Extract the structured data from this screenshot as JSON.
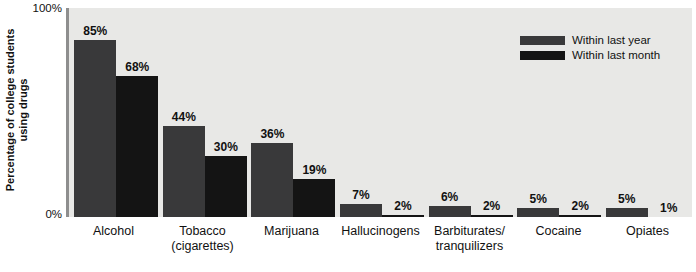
{
  "chart_data": {
    "type": "bar",
    "title": "",
    "xlabel": "",
    "ylabel": "Percentage of college students using drugs",
    "ylabel_line1": "Percentage of college students",
    "ylabel_line2": "using drugs",
    "ylim": [
      0,
      100
    ],
    "yticks": [
      "0%",
      "100%"
    ],
    "ytick_top": "100%",
    "ytick_bottom": "0%",
    "grid": false,
    "legend_position": "top-right",
    "categories": [
      "Alcohol",
      "Tobacco\n(cigarettes)",
      "Marijuana",
      "Hallucinogens",
      "Barbiturates/\ntranquilizers",
      "Cocaine",
      "Opiates"
    ],
    "series": [
      {
        "name": "Within last year",
        "color": "#39393a",
        "values": [
          85,
          44,
          36,
          7,
          6,
          5,
          5
        ],
        "labels": [
          "85%",
          "44%",
          "36%",
          "7%",
          "6%",
          "5%",
          "5%"
        ]
      },
      {
        "name": "Within last month",
        "color": "#141414",
        "values": [
          68,
          30,
          19,
          2,
          2,
          2,
          1
        ],
        "labels": [
          "68%",
          "30%",
          "19%",
          "2%",
          "2%",
          "2%",
          "1%"
        ]
      }
    ]
  },
  "legend": {
    "items": [
      {
        "label": "Within last year",
        "color": "#39393a"
      },
      {
        "label": "Within last month",
        "color": "#141414"
      }
    ]
  },
  "colors": {
    "plot_background": "#e8e8e6",
    "axis": "#8e8e8e",
    "bar_year": "#39393a",
    "bar_month": "#141414",
    "text": "#111111"
  }
}
